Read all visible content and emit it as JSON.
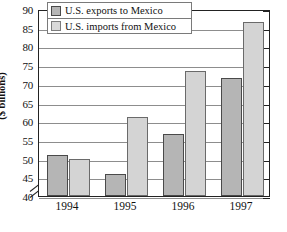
{
  "chart_data": {
    "type": "bar",
    "title": "",
    "xlabel": "",
    "ylabel": "($ billions)",
    "categories": [
      "1994",
      "1995",
      "1996",
      "1997"
    ],
    "series": [
      {
        "name": "U.S. exports to Mexico",
        "values": [
          51,
          46,
          56.5,
          71.5
        ],
        "color": "#b5b5b5"
      },
      {
        "name": "U.S. imports from Mexico",
        "values": [
          50,
          61,
          73.5,
          86.5
        ],
        "color": "#d4d4d4"
      }
    ],
    "ylim": [
      40,
      90
    ],
    "yticks": [
      40,
      45,
      50,
      55,
      60,
      65,
      70,
      75,
      80,
      85,
      90
    ],
    "ytick_labels": [
      "40",
      "45",
      "50",
      "55",
      "60",
      "65",
      "70",
      "75",
      "80",
      "85",
      "90"
    ],
    "axis_break": true,
    "axis_break_note": "y-axis broken below 40",
    "grid": true,
    "legend_position": "top-left"
  },
  "axis": {
    "y_title": "($ billions)"
  },
  "legend": {
    "items": [
      {
        "label": "U.S. exports to Mexico"
      },
      {
        "label": "U.S. imports from Mexico"
      }
    ]
  }
}
